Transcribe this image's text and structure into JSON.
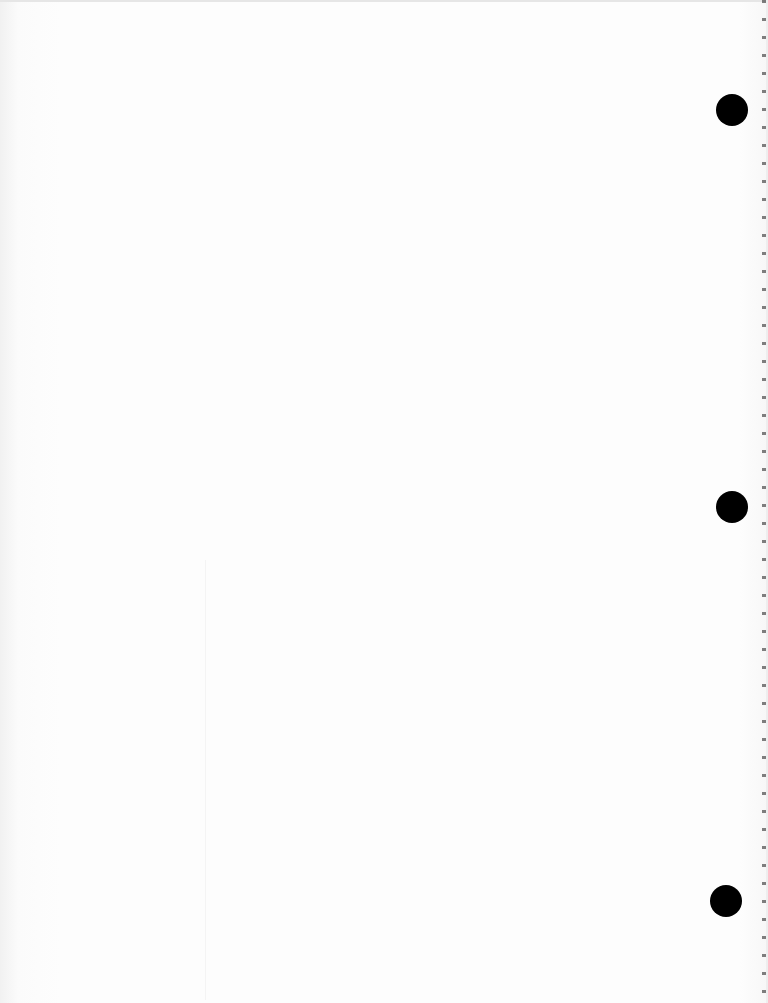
{
  "document": {
    "type": "scanned blank notebook page",
    "visible_text": "",
    "bleed_through_text": "",
    "background_color": "#fcfcfc",
    "hole_punch_color": "#000000",
    "hole_punches": [
      {
        "name": "top",
        "x": 716,
        "y": 94
      },
      {
        "name": "middle",
        "x": 716,
        "y": 491
      },
      {
        "name": "bottom",
        "x": 710,
        "y": 885
      }
    ]
  }
}
